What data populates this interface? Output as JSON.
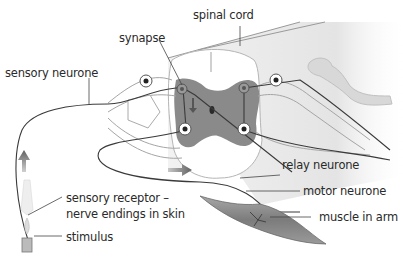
{
  "diagram": {
    "type": "reflex-arc",
    "colors": {
      "background": "#ffffff",
      "grey_matter": "#7a7a7a",
      "spinal_cord": "#e6e6e6",
      "outline": "#9a9a9a",
      "nerve": "#3a3a3a",
      "arrow": "#707070",
      "muscle": "#8a8a8a"
    },
    "labels": {
      "spinal_cord": "spinal cord",
      "synapse": "synapse",
      "sensory_neurone": "sensory neurone",
      "relay_neurone": "relay neurone",
      "motor_neurone": "motor neurone",
      "muscle": "muscle in arm",
      "receptor_line1": "sensory receptor –",
      "receptor_line2": "nerve endings in skin",
      "stimulus": "stimulus"
    },
    "icons": [
      "impulse-arrow-up",
      "impulse-arrow-right",
      "flame-stimulus",
      "cell-body"
    ]
  }
}
